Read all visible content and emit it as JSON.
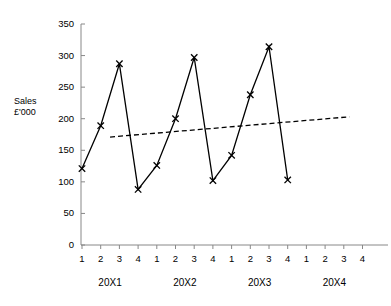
{
  "chart_data": {
    "type": "line",
    "title": "",
    "xlabel": "",
    "ylabel": "Sales\n£'000",
    "ylabel_line1": "Sales",
    "ylabel_line2": "£'000",
    "ylim": [
      0,
      350
    ],
    "ytick_step": 50,
    "yticks": [
      0,
      50,
      100,
      150,
      200,
      250,
      300,
      350
    ],
    "ytick_labels": [
      "0",
      "50",
      "100",
      "150",
      "200",
      "250",
      "300",
      "350"
    ],
    "grid": false,
    "legend": null,
    "categories": [
      "1",
      "2",
      "3",
      "4",
      "1",
      "2",
      "3",
      "4",
      "1",
      "2",
      "3",
      "4",
      "1",
      "2",
      "3",
      "4"
    ],
    "xtick_labels": [
      "1",
      "2",
      "3",
      "4",
      "1",
      "2",
      "3",
      "4",
      "1",
      "2",
      "3",
      "4",
      "1",
      "2",
      "3",
      "4"
    ],
    "group_labels": [
      "20X1",
      "20X2",
      "20X3",
      "20X4"
    ],
    "series": [
      {
        "name": "Sales",
        "marker": "x",
        "style": "solid",
        "color": "#000000",
        "x": [
          1,
          2,
          3,
          4,
          5,
          6,
          7,
          8,
          9,
          10,
          11,
          12
        ],
        "values": [
          121,
          189,
          287,
          88,
          126,
          200,
          297,
          102,
          142,
          238,
          314,
          103
        ]
      },
      {
        "name": "Trend line",
        "marker": "none",
        "style": "dashed",
        "color": "#000000",
        "x": [
          2.5,
          15.3
        ],
        "values": [
          171,
          203
        ]
      }
    ]
  },
  "axes": {
    "y_axis_name": "y-axis",
    "x_axis_name": "x-axis"
  }
}
